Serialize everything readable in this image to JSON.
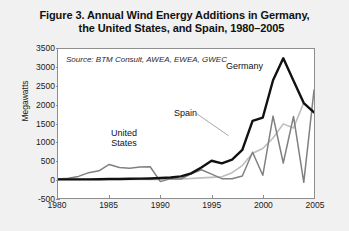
{
  "figure": {
    "title_line_1": "Figure 3. Annual Wind Energy Additions in Germany,",
    "title_line_2": "the United States, and Spain, 1980–2005",
    "source_note": "Source: BTM Consult, AWEA, EWEA, GWEC",
    "background_color": "#f1f1f1",
    "plot_background_color": "#ffffff",
    "frame_color": "#8e8e8e"
  },
  "labels": {
    "germany": "Germany",
    "united_states_line_1": "United",
    "united_states_line_2": "States",
    "spain": "Spain"
  },
  "chart_data": {
    "type": "line",
    "title": "Figure 3. Annual Wind Energy Additions in Germany, the United States, and Spain, 1980–2005",
    "xlabel": "",
    "ylabel": "Megawatts",
    "xlim": [
      1980,
      2005
    ],
    "ylim": [
      -500,
      3500
    ],
    "xticks": [
      1980,
      1985,
      1990,
      1995,
      2000,
      2005
    ],
    "yticks": [
      -500,
      0,
      500,
      1000,
      1500,
      2000,
      2500,
      3000,
      3500
    ],
    "grid": false,
    "legend_position": "inline-annotations",
    "annotations": [
      "Source: BTM Consult, AWEA, EWEA, GWEC"
    ],
    "x": [
      1980,
      1981,
      1982,
      1983,
      1984,
      1985,
      1986,
      1987,
      1988,
      1989,
      1990,
      1991,
      1992,
      1993,
      1994,
      1995,
      1996,
      1997,
      1998,
      1999,
      2000,
      2001,
      2002,
      2003,
      2004,
      2005
    ],
    "series": [
      {
        "name": "Germany",
        "color": "#111111",
        "line_width": 2.4,
        "values": [
          0,
          0,
          0,
          0,
          5,
          10,
          10,
          15,
          20,
          25,
          35,
          50,
          80,
          160,
          320,
          500,
          430,
          530,
          790,
          1570,
          1660,
          2660,
          3250,
          2650,
          2050,
          1800
        ]
      },
      {
        "name": "United States",
        "color": "#808080",
        "line_width": 1.5,
        "values": [
          10,
          30,
          80,
          180,
          230,
          400,
          320,
          300,
          330,
          340,
          -60,
          20,
          10,
          150,
          260,
          140,
          20,
          15,
          90,
          730,
          110,
          1700,
          440,
          1690,
          -80,
          2400
        ]
      },
      {
        "name": "Spain",
        "color": "#bdbdbd",
        "line_width": 1.6,
        "values": [
          0,
          0,
          0,
          0,
          0,
          0,
          0,
          0,
          0,
          0,
          0,
          5,
          10,
          25,
          40,
          55,
          70,
          180,
          370,
          700,
          830,
          1110,
          1490,
          1380,
          2060,
          1800
        ]
      }
    ]
  }
}
